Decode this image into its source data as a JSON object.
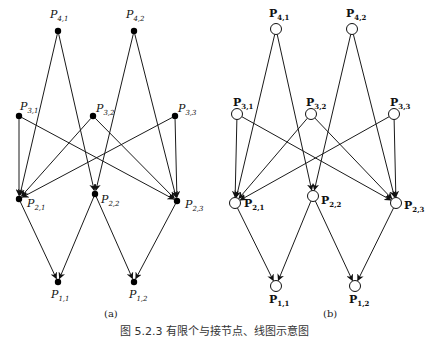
{
  "figure": {
    "caption": "图 5.2.3  有限个与接节点、线图示意图",
    "panels": [
      {
        "id": "a",
        "label": "(a)",
        "node_style": "filled",
        "label_style": "italic",
        "nodes": [
          {
            "id": "P41",
            "name": "P",
            "sub": "4,1",
            "x": 58,
            "y": 31,
            "lx": 50,
            "ly": 18
          },
          {
            "id": "P42",
            "name": "P",
            "sub": "4,2",
            "x": 134,
            "y": 31,
            "lx": 126,
            "ly": 18
          },
          {
            "id": "P31",
            "name": "P",
            "sub": "3,1",
            "x": 19,
            "y": 116,
            "lx": 20,
            "ly": 110
          },
          {
            "id": "P32",
            "name": "P",
            "sub": "3,2",
            "x": 93,
            "y": 116,
            "lx": 96,
            "ly": 112
          },
          {
            "id": "P33",
            "name": "P",
            "sub": "3,3",
            "x": 175,
            "y": 116,
            "lx": 178,
            "ly": 112
          },
          {
            "id": "P21",
            "name": "P",
            "sub": "2,1",
            "x": 19,
            "y": 199,
            "lx": 27,
            "ly": 207
          },
          {
            "id": "P22",
            "name": "P",
            "sub": "2,2",
            "x": 95,
            "y": 194,
            "lx": 101,
            "ly": 203
          },
          {
            "id": "P23",
            "name": "P",
            "sub": "2,3",
            "x": 177,
            "y": 201,
            "lx": 185,
            "ly": 208
          },
          {
            "id": "P11",
            "name": "P",
            "sub": "1,1",
            "x": 58,
            "y": 282,
            "lx": 51,
            "ly": 298
          },
          {
            "id": "P12",
            "name": "P",
            "sub": "1,2",
            "x": 134,
            "y": 282,
            "lx": 129,
            "ly": 298
          }
        ]
      },
      {
        "id": "b",
        "label": "(b)",
        "node_style": "hollow",
        "label_style": "bold",
        "nodes": [
          {
            "id": "P41",
            "name": "P",
            "sub": "4,1",
            "x": 276,
            "y": 29,
            "lx": 269,
            "ly": 17
          },
          {
            "id": "P42",
            "name": "P",
            "sub": "4,2",
            "x": 352,
            "y": 29,
            "lx": 346,
            "ly": 17
          },
          {
            "id": "P31",
            "name": "P",
            "sub": "3,1",
            "x": 237,
            "y": 114,
            "lx": 233,
            "ly": 106
          },
          {
            "id": "P32",
            "name": "P",
            "sub": "3,2",
            "x": 311,
            "y": 114,
            "lx": 306,
            "ly": 106
          },
          {
            "id": "P33",
            "name": "P",
            "sub": "3,3",
            "x": 394,
            "y": 114,
            "lx": 390,
            "ly": 106
          },
          {
            "id": "P21",
            "name": "P",
            "sub": "2,1",
            "x": 235,
            "y": 203,
            "lx": 244,
            "ly": 207
          },
          {
            "id": "P22",
            "name": "P",
            "sub": "2,2",
            "x": 313,
            "y": 196,
            "lx": 321,
            "ly": 204
          },
          {
            "id": "P23",
            "name": "P",
            "sub": "2,3",
            "x": 396,
            "y": 203,
            "lx": 404,
            "ly": 209
          },
          {
            "id": "P11",
            "name": "P",
            "sub": "1,1",
            "x": 276,
            "y": 286,
            "lx": 269,
            "ly": 303
          },
          {
            "id": "P12",
            "name": "P",
            "sub": "1,2",
            "x": 355,
            "y": 286,
            "lx": 349,
            "ly": 303
          }
        ]
      }
    ],
    "edges": [
      [
        "P41",
        "P21"
      ],
      [
        "P41",
        "P22"
      ],
      [
        "P42",
        "P22"
      ],
      [
        "P42",
        "P23"
      ],
      [
        "P31",
        "P21"
      ],
      [
        "P31",
        "P23"
      ],
      [
        "P32",
        "P21"
      ],
      [
        "P32",
        "P23"
      ],
      [
        "P33",
        "P21"
      ],
      [
        "P33",
        "P23"
      ],
      [
        "P21",
        "P11"
      ],
      [
        "P22",
        "P11"
      ],
      [
        "P22",
        "P12"
      ],
      [
        "P23",
        "P12"
      ]
    ],
    "panel_caption_positions": [
      {
        "x": 104,
        "y": 317
      },
      {
        "x": 323,
        "y": 317
      }
    ],
    "colors": {
      "line": "#1a1a1a",
      "node_fill": "#000000",
      "background": "#ffffff"
    }
  }
}
